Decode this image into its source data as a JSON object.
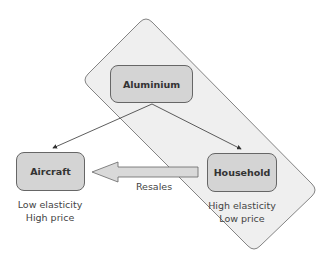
{
  "nodes": {
    "aluminium": {
      "label": "Aluminium"
    },
    "aircraft": {
      "label": "Aircraft",
      "caption_line1": "Low elasticity",
      "caption_line2": "High price"
    },
    "household": {
      "label": "Household",
      "caption_line1": "High elasticity",
      "caption_line2": "Low price"
    }
  },
  "edges": {
    "resales": {
      "label": "Resales"
    }
  },
  "colors": {
    "band": "#efefef",
    "box": "#d4d4d4",
    "stroke": "#666666"
  }
}
